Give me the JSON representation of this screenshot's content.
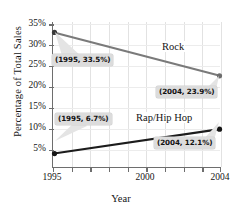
{
  "chart_data": {
    "type": "line",
    "title": "",
    "xlabel": "Year",
    "ylabel": "Percentage of Total Sales",
    "x": [
      1995,
      2004
    ],
    "xlim": [
      1995,
      2004
    ],
    "ylim": [
      3.5,
      35.8
    ],
    "grid": true,
    "legend_position": "inline-labels",
    "xticks": [
      {
        "value": 1995,
        "label": "1995",
        "major": true
      },
      {
        "value": 1996,
        "label": "",
        "major": false
      },
      {
        "value": 1997,
        "label": "",
        "major": false
      },
      {
        "value": 1998,
        "label": "",
        "major": false
      },
      {
        "value": 1999,
        "label": "",
        "major": false
      },
      {
        "value": 2000,
        "label": "2000",
        "major": true
      },
      {
        "value": 2001,
        "label": "",
        "major": false
      },
      {
        "value": 2002,
        "label": "",
        "major": false
      },
      {
        "value": 2003,
        "label": "",
        "major": false
      },
      {
        "value": 2004,
        "label": "2004",
        "major": true
      }
    ],
    "yticks": [
      {
        "value": 5,
        "label": "5%"
      },
      {
        "value": 10,
        "label": "10%"
      },
      {
        "value": 15,
        "label": "15%"
      },
      {
        "value": 20,
        "label": "20%"
      },
      {
        "value": 25,
        "label": "25%"
      },
      {
        "value": 30,
        "label": "30%"
      },
      {
        "value": 35,
        "label": "35%"
      }
    ],
    "series": [
      {
        "name": "Rock",
        "color": "#7a7a7a",
        "values": [
          33.5,
          23.9
        ],
        "label_text": "Rock"
      },
      {
        "name": "Rap/Hip Hop",
        "color": "#1c1c1c",
        "values": [
          6.7,
          12.1
        ],
        "label_text": "Rap/Hip Hop"
      }
    ],
    "annotations": [
      {
        "id": "rock-1995",
        "text": "(1995, 33.5%)",
        "x": 1995,
        "y": 33.5
      },
      {
        "id": "rock-2004",
        "text": "(2004, 23.9%)",
        "x": 2004,
        "y": 23.9
      },
      {
        "id": "rap-1995",
        "text": "(1995, 6.7%)",
        "x": 1995,
        "y": 6.7
      },
      {
        "id": "rap-2004",
        "text": "(2004, 12.1%)",
        "x": 2004,
        "y": 12.1
      }
    ]
  },
  "axis": {
    "y_title": "Percentage of Total Sales",
    "x_title": "Year",
    "y_labels": [
      "35%",
      "30%",
      "25%",
      "20%",
      "15%",
      "10%",
      "5%"
    ],
    "x_labels": [
      "1995",
      "2000",
      "2004"
    ]
  },
  "series_labels": {
    "rock": "Rock",
    "rap": "Rap/Hip Hop"
  },
  "callouts": {
    "rock_1995": "(1995, 33.5%)",
    "rock_2004": "(2004, 23.9%)",
    "rap_1995": "(1995, 6.7%)",
    "rap_2004": "(2004, 12.1%)"
  },
  "colors": {
    "rock_line": "#7a7a7a",
    "rap_line": "#1c1c1c",
    "axis": "#6e6e6e",
    "callout_bg": "#dcdcdc",
    "gridline": "#e2e2e2"
  }
}
